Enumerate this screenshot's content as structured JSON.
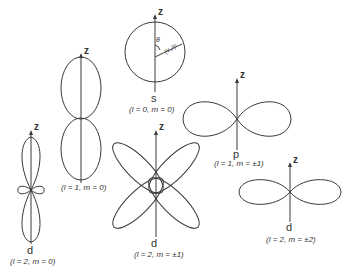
{
  "colors": {
    "stroke": "#3a3a3a",
    "text": "#333333",
    "background": "#ffffff"
  },
  "axis_label": "z",
  "angle_label": "θ",
  "radius_label": "|Y₀⁰|²",
  "orbitals": [
    {
      "id": "s",
      "letter": "s",
      "quantum": "(l = 0, m = 0)",
      "shape": "sphere"
    },
    {
      "id": "p-m0",
      "letter": "",
      "quantum": "(l = 1, m = 0)",
      "shape": "vertical-dumbbell"
    },
    {
      "id": "p-m1",
      "letter": "p",
      "quantum": "(l = 1, m = ±1)",
      "shape": "horizontal-dumbbell"
    },
    {
      "id": "d-m0",
      "letter": "d",
      "quantum": "(l = 2, m = 0)",
      "shape": "vertical-lobes-with-torus"
    },
    {
      "id": "d-m1",
      "letter": "d",
      "quantum": "(l = 2, m = ±1)",
      "shape": "four-lobe-clover"
    },
    {
      "id": "d-m2",
      "letter": "d",
      "quantum": "(l = 2, m = ±2)",
      "shape": "horizontal-dumbbell"
    }
  ]
}
